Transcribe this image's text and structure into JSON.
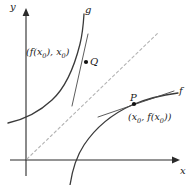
{
  "figure": {
    "background_color": "#ffffff",
    "curve_color": "#3a3a3a",
    "axis_color": "#2a2a2a",
    "dashed_line_color": "#b0b0b0",
    "point_color": "#111111",
    "label_color": "#1a1a1a"
  },
  "axes": {
    "y_label": "y",
    "x_label": "x",
    "origin": {
      "x": 26,
      "y": 160
    }
  },
  "curves": [
    {
      "name": "g",
      "label": "g",
      "description": "increasing concave-up curve in upper left, reflection of f about y = x"
    },
    {
      "name": "f",
      "label": "f",
      "description": "increasing concave-down curve in lower right"
    }
  ],
  "diagonal": {
    "label": "",
    "style": "dashed",
    "description": "line y = x through the origin"
  },
  "points": [
    {
      "name": "Q",
      "label": "Q",
      "coordinate_label": "(f(x0), x0)",
      "coordinate_parts": {
        "prefix": "(f(x",
        "sub1": "0",
        "mid": "), x",
        "sub2": "0",
        "suffix": ")"
      },
      "x": 86,
      "y": 62
    },
    {
      "name": "P",
      "label": "P",
      "coordinate_label": "(x0, f(x0))",
      "coordinate_parts": {
        "prefix": "(x",
        "sub1": "0",
        "mid": ", f(x",
        "sub2": "0",
        "suffix": "))"
      },
      "x": 134,
      "y": 104
    }
  ],
  "tangents": [
    {
      "at_point": "Q",
      "description": "steep tangent line to g at Q"
    },
    {
      "at_point": "P",
      "description": "shallow tangent line to f at P"
    }
  ]
}
